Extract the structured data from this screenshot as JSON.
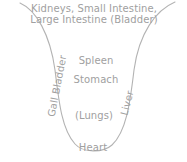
{
  "diagram": {
    "title_lines": [
      "Kidneys, Small Intestine,",
      "Large Intestine (Bladder)"
    ],
    "labels": {
      "spleen": "Spleen",
      "stomach": "Stomach",
      "lungs": "(Lungs)",
      "heart": "Heart",
      "gall_bladder": "Gall Bladder",
      "liver": "Liver"
    },
    "colors": {
      "stroke": "#b3b3b3",
      "text": "#a0a0a0",
      "background": "#ffffff"
    }
  }
}
